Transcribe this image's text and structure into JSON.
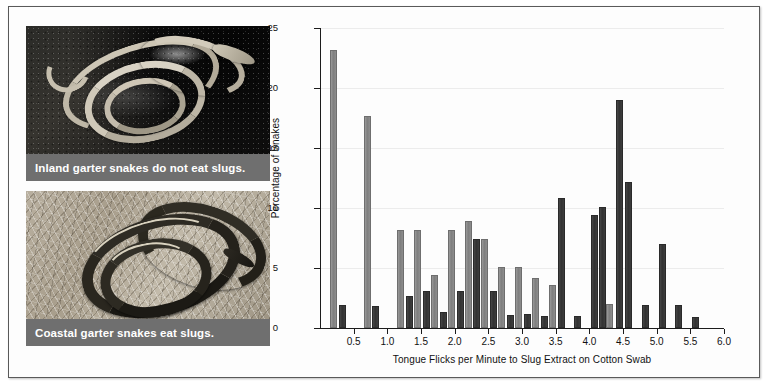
{
  "figure": {
    "photos": [
      {
        "name": "inland-garter-snake-photo",
        "caption": "Inland garter snakes do not eat slugs.",
        "alt": "Pale striped garter snake coiled on dark rocky soil"
      },
      {
        "name": "coastal-garter-snake-photo",
        "caption": "Coastal garter snakes eat slugs.",
        "alt": "Dark striped garter snake coiled on dry grass"
      }
    ]
  },
  "chart_data": {
    "type": "bar",
    "title": "",
    "subtitle": "",
    "xlabel": "Tongue Flicks per Minute to Slug Extract on Cotton Swab",
    "ylabel": "Percentage of Snakes",
    "xlim": [
      0,
      6.0
    ],
    "ylim": [
      0,
      25
    ],
    "xticks": [
      "0.5",
      "1.0",
      "1.5",
      "2.0",
      "2.5",
      "3.0",
      "3.5",
      "4.0",
      "4.5",
      "5.0",
      "5.5",
      "6.0"
    ],
    "xtick_values": [
      0.5,
      1.0,
      1.5,
      2.0,
      2.5,
      3.0,
      3.5,
      4.0,
      4.5,
      5.0,
      5.5,
      6.0
    ],
    "yticks": [
      "0",
      "5",
      "10",
      "15",
      "20",
      "25"
    ],
    "ytick_values": [
      0,
      5,
      10,
      15,
      20,
      25
    ],
    "grid": "horizontal",
    "legend_position": "none",
    "bin_width": 0.25,
    "colors": {
      "inland": "#8a8a8a",
      "coastal": "#3a3a3a",
      "axis": "#1c1c1c",
      "gridline": "#ececec",
      "caption_bar": "#6f6f6f",
      "frame": "#5a5a5a"
    },
    "series": [
      {
        "name": "Inland garter snakes",
        "color": "#8a8a8a",
        "x": [
          0.2,
          0.7,
          1.2,
          1.45,
          1.7,
          1.95,
          2.2,
          2.45,
          2.7,
          2.95,
          3.2,
          3.45,
          4.3
        ],
        "values": [
          23.2,
          17.7,
          8.2,
          8.2,
          4.4,
          8.2,
          8.9,
          7.4,
          5.1,
          5.1,
          4.2,
          3.6,
          2.0
        ]
      },
      {
        "name": "Coastal garter snakes",
        "color": "#3a3a3a",
        "x": [
          0.33,
          0.83,
          1.33,
          1.58,
          1.83,
          2.08,
          2.33,
          2.58,
          2.83,
          3.08,
          3.33,
          3.58,
          3.83,
          4.08,
          4.2,
          4.45,
          4.58,
          4.83,
          5.08,
          5.33,
          5.58
        ],
        "values": [
          1.9,
          1.8,
          2.7,
          3.1,
          1.3,
          3.1,
          7.4,
          3.1,
          1.1,
          1.2,
          1.0,
          10.8,
          1.0,
          9.4,
          10.1,
          19.0,
          12.2,
          1.9,
          7.0,
          1.9,
          0.9
        ]
      }
    ]
  }
}
